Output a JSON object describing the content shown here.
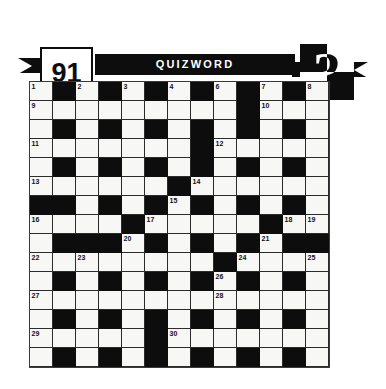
{
  "banner": {
    "issue_number": "91",
    "title": "QUIZWORD",
    "logo_icon": "question-mark-icon",
    "logo_glyph": "?",
    "colors": {
      "ink": "#0d0d0d",
      "paper": "#ffffff",
      "cell_fill": "#f7f7f5",
      "grid_line": "#2b2b2b"
    }
  },
  "puzzle": {
    "type": "crossword",
    "columns": 13,
    "rows": 15,
    "cell_size_px": 23,
    "clue_number_count": 30,
    "clue_numbers_visible": [
      1,
      2,
      3,
      4,
      5,
      6,
      7,
      8,
      9,
      10,
      11,
      12,
      13,
      14,
      15,
      16,
      17,
      18,
      19,
      20,
      21,
      22,
      23,
      24,
      25,
      26,
      27,
      28,
      29,
      30
    ],
    "legend": {
      "1": "white-open-cell",
      "0": "black-block-cell"
    },
    "grid": [
      [
        1,
        0,
        1,
        0,
        1,
        0,
        1,
        0,
        1,
        0,
        1,
        0,
        1
      ],
      [
        1,
        1,
        1,
        1,
        1,
        1,
        1,
        1,
        1,
        0,
        1,
        1,
        1
      ],
      [
        1,
        0,
        1,
        0,
        1,
        0,
        1,
        0,
        1,
        0,
        1,
        0,
        1
      ],
      [
        1,
        1,
        1,
        1,
        1,
        1,
        1,
        0,
        1,
        1,
        1,
        1,
        1
      ],
      [
        1,
        0,
        1,
        0,
        1,
        0,
        1,
        0,
        1,
        0,
        1,
        0,
        1
      ],
      [
        1,
        1,
        1,
        1,
        1,
        1,
        0,
        1,
        1,
        1,
        1,
        1,
        1
      ],
      [
        0,
        0,
        1,
        0,
        1,
        0,
        1,
        0,
        1,
        0,
        1,
        0,
        1
      ],
      [
        1,
        1,
        1,
        1,
        0,
        1,
        1,
        1,
        1,
        1,
        0,
        1,
        1
      ],
      [
        1,
        0,
        0,
        0,
        1,
        0,
        1,
        0,
        1,
        0,
        1,
        0,
        0
      ],
      [
        1,
        1,
        1,
        1,
        1,
        1,
        1,
        1,
        0,
        1,
        1,
        1,
        1
      ],
      [
        1,
        0,
        1,
        0,
        1,
        0,
        1,
        0,
        1,
        0,
        1,
        0,
        1
      ],
      [
        1,
        1,
        1,
        1,
        1,
        1,
        1,
        1,
        1,
        1,
        1,
        1,
        1
      ],
      [
        1,
        0,
        1,
        0,
        1,
        0,
        1,
        0,
        1,
        0,
        1,
        0,
        1
      ],
      [
        1,
        1,
        1,
        1,
        1,
        0,
        1,
        1,
        1,
        1,
        1,
        1,
        1
      ],
      [
        1,
        0,
        1,
        0,
        1,
        0,
        1,
        0,
        1,
        0,
        1,
        0,
        1
      ]
    ],
    "numbers": {
      "0,0": "1",
      "0,2": "2",
      "0,4": "3",
      "0,6": "4",
      "0,8": "5",
      "0,10": "6",
      "0,12": "7",
      "1,0": "9",
      "1,10": "10",
      "3,0": "11",
      "3,8": "12",
      "5,0": "13",
      "5,7": "14",
      "6,6": "15",
      "7,0": "16",
      "7,5": "17",
      "7,11": "18",
      "7,12": "19",
      "8,4": "20",
      "8,10": "21",
      "9,0": "22",
      "9,2": "23",
      "9,9": "24",
      "9,12": "25",
      "10,8": "26",
      "11,0": "27",
      "11,8": "28",
      "13,0": "29",
      "13,6": "30"
    },
    "extra_numbers": {
      "0,12b": "8"
    }
  }
}
